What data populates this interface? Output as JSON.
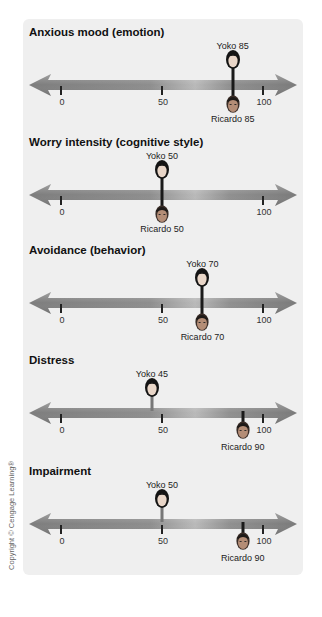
{
  "chart_data": {
    "type": "dot-scale",
    "scale": {
      "min": 0,
      "max": 100,
      "ticks": [
        0,
        50,
        100
      ]
    },
    "persons": [
      "Yoko",
      "Ricardo"
    ],
    "dimensions": [
      {
        "title": "Anxious mood (emotion)",
        "Yoko": 85,
        "Ricardo": 85
      },
      {
        "title": "Worry intensity (cognitive style)",
        "Yoko": 50,
        "Ricardo": 50
      },
      {
        "title": "Avoidance (behavior)",
        "Yoko": 70,
        "Ricardo": 70
      },
      {
        "title": "Distress",
        "Yoko": 45,
        "Ricardo": 90
      },
      {
        "title": "Impairment",
        "Yoko": 50,
        "Ricardo": 90
      }
    ]
  },
  "sections": [
    {
      "title": "Anxious mood (emotion)",
      "yoko_label": "Yoko 85",
      "ricardo_label": "Ricardo 85",
      "ticks": [
        "0",
        "50",
        "100"
      ]
    },
    {
      "title": "Worry intensity (cognitive style)",
      "yoko_label": "Yoko 50",
      "ricardo_label": "Ricardo 50",
      "ticks": [
        "0",
        "",
        "100"
      ]
    },
    {
      "title": "Avoidance (behavior)",
      "yoko_label": "Yoko 70",
      "ricardo_label": "Ricardo 70",
      "ticks": [
        "0",
        "50",
        "100"
      ]
    },
    {
      "title": "Distress",
      "yoko_label": "Yoko 45",
      "ricardo_label": "Ricardo 90",
      "ticks": [
        "0",
        "50",
        "100"
      ]
    },
    {
      "title": "Impairment",
      "yoko_label": "Yoko 50",
      "ricardo_label": "Ricardo 90",
      "ticks": [
        "0",
        "50",
        "100"
      ]
    }
  ],
  "copyright": "Copyright © Cengage Learning®",
  "colors": {
    "panel_bg": "#efefef",
    "arrow": "#8a8a8a",
    "stem": "#1a1a1a"
  }
}
